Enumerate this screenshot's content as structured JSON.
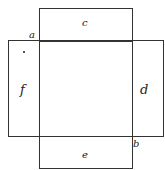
{
  "diagram": {
    "faces": {
      "top": {
        "label": "c"
      },
      "left": {
        "label": "f"
      },
      "right": {
        "label": "d"
      },
      "bottom": {
        "label": "e"
      }
    },
    "vertices": {
      "top_left_corner": {
        "label": "a"
      },
      "bottom_right_corner": {
        "label": "b"
      }
    },
    "colors": {
      "line": "#333333",
      "background": "#ffffff"
    }
  }
}
